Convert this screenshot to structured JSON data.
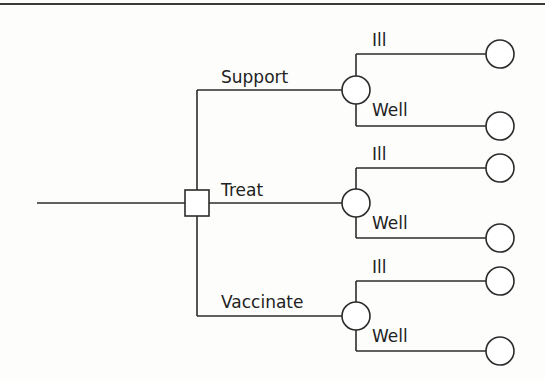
{
  "diagram": {
    "type": "decision-tree",
    "colors": {
      "line": "#2b2b2b",
      "background": "#fdfdfc",
      "node_fill": "#ffffff"
    },
    "root": {
      "node_type": "decision",
      "shape": "square"
    },
    "branches": [
      {
        "label": "Support",
        "node_type": "chance",
        "outcomes": [
          {
            "label": "Ill",
            "terminal": "circle"
          },
          {
            "label": "Well",
            "terminal": "circle"
          }
        ]
      },
      {
        "label": "Treat",
        "node_type": "chance",
        "outcomes": [
          {
            "label": "Ill",
            "terminal": "circle"
          },
          {
            "label": "Well",
            "terminal": "circle"
          }
        ]
      },
      {
        "label": "Vaccinate",
        "node_type": "chance",
        "outcomes": [
          {
            "label": "Ill",
            "terminal": "circle"
          },
          {
            "label": "Well",
            "terminal": "circle"
          }
        ]
      }
    ]
  }
}
